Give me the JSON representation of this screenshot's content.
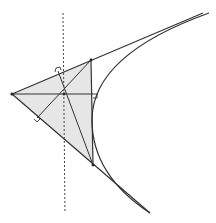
{
  "diagram": {
    "colors": {
      "background": "#ffffff",
      "stroke": "#333333",
      "triangle_fill": "#e6e6e6",
      "directrix": "#444444"
    },
    "triangle": {
      "A_left": [
        12,
        94
      ],
      "B_top": [
        91,
        60
      ],
      "C_bottom": [
        93,
        165
      ]
    },
    "orthocenter": [
      64,
      94
    ],
    "directrix": {
      "from": [
        63,
        13
      ],
      "to": [
        65,
        213
      ]
    },
    "parabola": {
      "path": "M 209 13 Q 92 55 92 120 Q 92 175 150 213"
    },
    "tangent_lines": [
      {
        "name": "top-tangent",
        "from": [
          12,
          94
        ],
        "to": [
          203,
          13
        ]
      },
      {
        "name": "bottom-tangent",
        "from": [
          12,
          94
        ],
        "to": [
          150,
          213
        ]
      }
    ],
    "altitudes": [
      {
        "name": "altitude-from-A",
        "from": [
          12,
          94
        ],
        "to": [
          93,
          94
        ]
      },
      {
        "name": "altitude-from-B",
        "from": [
          91,
          60
        ],
        "to": [
          37,
          118
        ]
      },
      {
        "name": "altitude-from-C",
        "from": [
          93,
          165
        ],
        "to": [
          58,
          71
        ]
      }
    ],
    "right_angle_marks": [
      {
        "name": "right-angle-mark-right-side",
        "at": [
          93,
          94
        ]
      },
      {
        "name": "right-angle-mark-top-side",
        "at": [
          58,
          71
        ]
      },
      {
        "name": "right-angle-mark-bottom-side",
        "at": [
          37,
          118
        ]
      }
    ]
  }
}
